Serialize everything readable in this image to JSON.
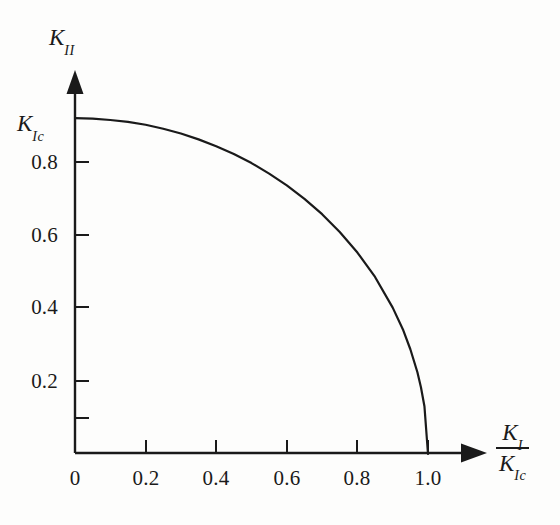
{
  "figure": {
    "background_color": "#fdfdfc",
    "ink_color": "#1a1a1a"
  },
  "axes": {
    "y_title_symbol": "K",
    "y_title_subscript": "II",
    "x_title_numerator_symbol": "K",
    "x_title_numerator_subscript": "I",
    "x_title_denominator_symbol": "K",
    "x_title_denominator_subscript": "Ic",
    "y_top_label_symbol": "K",
    "y_top_label_subscript": "Ic"
  },
  "ticks": {
    "x_labels": [
      "0",
      "0.2",
      "0.4",
      "0.6",
      "0.8",
      "1.0"
    ],
    "x_values": [
      0,
      0.2,
      0.4,
      0.6,
      0.8,
      1.0
    ],
    "y_labels": [
      "0.2",
      "0.4",
      "0.6",
      "0.8"
    ],
    "y_values": [
      0.2,
      0.4,
      0.6,
      0.8
    ]
  },
  "chart_data": {
    "type": "line",
    "title": "",
    "subtitle": "",
    "xlabel": "K_I / K_Ic",
    "ylabel": "K_II",
    "xlim": [
      0,
      1.1
    ],
    "ylim": [
      0,
      1.05
    ],
    "grid": false,
    "legend": null,
    "annotations": [],
    "axis_style": {
      "spines": [
        "left",
        "bottom"
      ],
      "arrow_heads": [
        "x-positive",
        "y-positive"
      ],
      "tick_direction": "in"
    },
    "series": [
      {
        "name": "Mixed-mode fracture envelope",
        "equation": "(K_I/K_Ic)^2 + (K_II/K_Ic)^2 = 1",
        "color": "#1a1a1a",
        "linewidth": 2.2,
        "x": [
          0.0,
          0.05,
          0.1,
          0.15,
          0.2,
          0.25,
          0.3,
          0.35,
          0.4,
          0.45,
          0.5,
          0.55,
          0.6,
          0.65,
          0.7,
          0.75,
          0.8,
          0.85,
          0.9,
          0.93,
          0.95,
          0.97,
          0.98,
          0.99,
          1.0
        ],
        "y": [
          0.92,
          0.919,
          0.915,
          0.91,
          0.902,
          0.891,
          0.878,
          0.862,
          0.843,
          0.822,
          0.797,
          0.768,
          0.736,
          0.699,
          0.657,
          0.608,
          0.552,
          0.485,
          0.401,
          0.339,
          0.287,
          0.224,
          0.183,
          0.13,
          0.0
        ]
      }
    ],
    "x_ticks": [
      0,
      0.2,
      0.4,
      0.6,
      0.8,
      1.0
    ],
    "x_ticklabels": [
      "0",
      "0.2",
      "0.4",
      "0.6",
      "0.8",
      "1.0"
    ],
    "y_ticks": [
      0.2,
      0.4,
      0.6,
      0.8,
      0.92
    ],
    "y_ticklabels": [
      "0.2",
      "0.4",
      "0.6",
      "0.8",
      "K_Ic"
    ]
  }
}
